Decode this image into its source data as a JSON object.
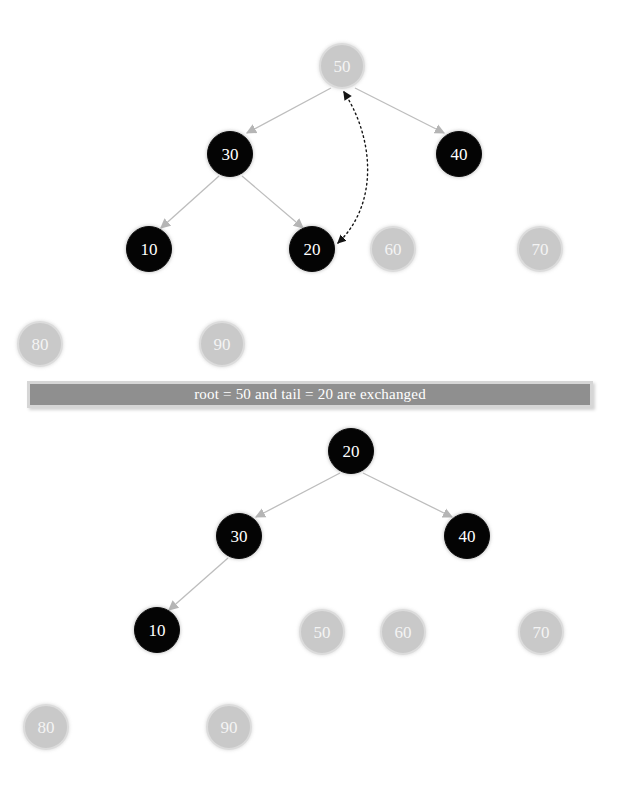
{
  "canvas": {
    "width": 620,
    "height": 793,
    "background": "#ffffff"
  },
  "palette": {
    "active_node_fill": "#040404",
    "active_node_text": "#ffffff",
    "inactive_node_fill": "#c9c9c9",
    "inactive_node_ring": "#dcdcdc",
    "inactive_node_text": "#f4f4f4",
    "edge_color": "#bdbdbd",
    "arrowhead_color": "#b5b5b5",
    "swap_arrow_color": "#111111",
    "banner_fill": "#8f8f8f",
    "banner_border": "#d6d6d6",
    "banner_text": "#ffffff"
  },
  "banner": {
    "text": "root = 50 and tail = 20 are exchanged",
    "root_value": "50",
    "tail_value": "20"
  },
  "diagram": {
    "title_before": "heap before exchange",
    "title_after": "heap after exchange",
    "panels": [
      {
        "id": "before",
        "nodes": [
          {
            "label": "50",
            "state": "inactive",
            "cx": 342,
            "cy": 66
          },
          {
            "label": "30",
            "state": "active",
            "cx": 230,
            "cy": 154
          },
          {
            "label": "40",
            "state": "active",
            "cx": 459,
            "cy": 154
          },
          {
            "label": "10",
            "state": "active",
            "cx": 149,
            "cy": 249
          },
          {
            "label": "20",
            "state": "active",
            "cx": 312,
            "cy": 249
          },
          {
            "label": "60",
            "state": "inactive",
            "cx": 393,
            "cy": 249
          },
          {
            "label": "70",
            "state": "inactive",
            "cx": 540,
            "cy": 249
          },
          {
            "label": "80",
            "state": "inactive",
            "cx": 40,
            "cy": 344
          },
          {
            "label": "90",
            "state": "inactive",
            "cx": 222,
            "cy": 344
          }
        ],
        "edges": [
          {
            "from": "50",
            "to": "30"
          },
          {
            "from": "50",
            "to": "40"
          },
          {
            "from": "30",
            "to": "10"
          },
          {
            "from": "30",
            "to": "20"
          }
        ],
        "swap_arrow": {
          "from": "50",
          "to": "20",
          "style": "dotted",
          "double_headed": true
        }
      },
      {
        "id": "after",
        "nodes": [
          {
            "label": "20",
            "state": "active",
            "cx": 351,
            "cy": 451
          },
          {
            "label": "30",
            "state": "active",
            "cx": 239,
            "cy": 536
          },
          {
            "label": "40",
            "state": "active",
            "cx": 467,
            "cy": 536
          },
          {
            "label": "10",
            "state": "active",
            "cx": 157,
            "cy": 630
          },
          {
            "label": "50",
            "state": "inactive",
            "cx": 322,
            "cy": 632
          },
          {
            "label": "60",
            "state": "inactive",
            "cx": 403,
            "cy": 632
          },
          {
            "label": "70",
            "state": "inactive",
            "cx": 541,
            "cy": 632
          },
          {
            "label": "80",
            "state": "inactive",
            "cx": 46,
            "cy": 727
          },
          {
            "label": "90",
            "state": "inactive",
            "cx": 229,
            "cy": 727
          }
        ],
        "edges": [
          {
            "from": "20",
            "to": "30"
          },
          {
            "from": "20",
            "to": "40"
          },
          {
            "from": "30",
            "to": "10"
          }
        ],
        "swap_arrow": null
      }
    ]
  }
}
